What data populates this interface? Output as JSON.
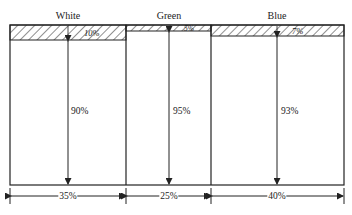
{
  "diagram": {
    "type": "mosaic-area-diagram",
    "columns": [
      {
        "name": "White",
        "width_pct": "35%",
        "top_pct": "10%",
        "bottom_pct": "90%"
      },
      {
        "name": "Green",
        "width_pct": "25%",
        "top_pct": "5%",
        "bottom_pct": "95%"
      },
      {
        "name": "Blue",
        "width_pct": "40%",
        "top_pct": "7%",
        "bottom_pct": "93%"
      }
    ]
  },
  "colors": {
    "line": "#222222",
    "background": "#ffffff"
  }
}
